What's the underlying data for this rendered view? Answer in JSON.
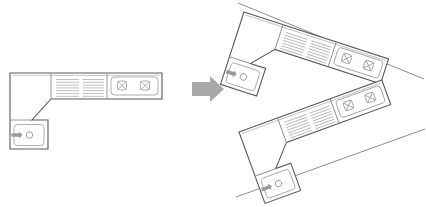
{
  "document": {
    "title": "Kitchen counter layout rotation",
    "background_color": "#ffffff",
    "width": 426,
    "height": 207
  },
  "palette": {
    "outline": "#5a5a5e",
    "wall": "#8d8d91",
    "fixture": "#9d9da1",
    "hatch": "#a9a9ad",
    "arrow": "#a9a9a9",
    "fill": "#ffffff"
  },
  "panels": [
    {
      "id": "original-layout",
      "name": "original-layout",
      "rotation_deg": 0,
      "has_wall_line": false,
      "origin": {
        "x": 0,
        "y": 0
      }
    },
    {
      "id": "rotated-clockwise-layout",
      "name": "rotated-clockwise-layout",
      "rotation_deg": 18,
      "has_wall_line": true,
      "wall_line": {
        "x1": 238,
        "y1": 3,
        "x2": 424,
        "y2": 79
      },
      "origin": {
        "x": 232,
        "y": -8
      }
    },
    {
      "id": "rotated-counterclockwise-layout",
      "name": "rotated-counterclockwise-layout",
      "rotation_deg": -20,
      "has_wall_line": true,
      "wall_line": {
        "x1": 236,
        "y1": 197,
        "x2": 425,
        "y2": 129
      },
      "origin": {
        "x": 236,
        "y": 176
      }
    }
  ],
  "layout": {
    "name": "L-shaped kitchen counter",
    "counter_depth": 26,
    "segments": [
      {
        "name": "left-leg-counter",
        "label": "left vertical counter run"
      },
      {
        "name": "sink-base-cabinet",
        "label": "sink base cabinet"
      },
      {
        "name": "drawer-cabinet-run",
        "label": "drawer cabinet run"
      },
      {
        "name": "hob-counter",
        "label": "cooktop counter"
      }
    ],
    "fixtures": [
      {
        "name": "sink",
        "type": "sink",
        "parts": [
          "basin",
          "drain",
          "faucet"
        ],
        "drain_radius": 3.2
      },
      {
        "name": "cooktop",
        "type": "hob",
        "burner_count": 2,
        "burner_glyph": "crossed-square"
      },
      {
        "name": "drawer-front-hatching",
        "type": "hatch-group",
        "group_count": 2,
        "lines_per_group": 7
      }
    ]
  },
  "arrow": {
    "name": "transform-arrow",
    "direction": "right",
    "color": "#a9a9a9",
    "position": {
      "x": 192,
      "y": 85
    },
    "width": 32,
    "height": 24
  }
}
